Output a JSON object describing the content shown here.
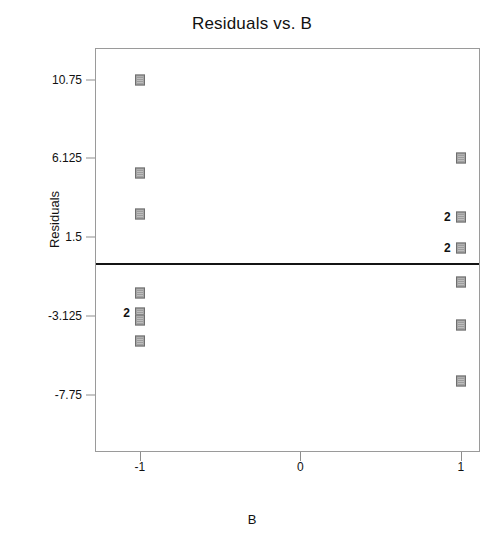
{
  "chart_data": {
    "type": "scatter",
    "title": "Residuals vs. B",
    "xlabel": "B",
    "ylabel": "Residuals",
    "grid": false,
    "legend": null,
    "xtick_labels": [
      "-1",
      "0",
      "1"
    ],
    "xtick_values": [
      -1,
      0,
      1
    ],
    "ytick_labels": [
      "10.75",
      "6.125",
      "1.5",
      "-3.125",
      "-7.75"
    ],
    "ytick_values": [
      10.75,
      6.125,
      1.5,
      -3.125,
      -7.75
    ],
    "xlim": [
      -1.28,
      1.12
    ],
    "ylim": [
      -11.1,
      12.6
    ],
    "reference_line": {
      "y": 0,
      "orientation": "horizontal",
      "color": "#141414"
    },
    "marker": {
      "shape": "square",
      "fill": "#a5a5a5",
      "edge": "#6e6e6e",
      "size": 10
    },
    "points": [
      {
        "x": -1,
        "y": 10.75,
        "count": 1,
        "count_label": ""
      },
      {
        "x": -1,
        "y": 5.25,
        "count": 1,
        "count_label": ""
      },
      {
        "x": -1,
        "y": 2.85,
        "count": 1,
        "count_label": ""
      },
      {
        "x": -1,
        "y": -1.8,
        "count": 1,
        "count_label": ""
      },
      {
        "x": -1,
        "y": -2.93,
        "count": 2,
        "count_label": "2"
      },
      {
        "x": -1,
        "y": -3.37,
        "count": 1,
        "count_label": ""
      },
      {
        "x": -1,
        "y": -4.59,
        "count": 1,
        "count_label": ""
      },
      {
        "x": 1,
        "y": 6.12,
        "count": 1,
        "count_label": ""
      },
      {
        "x": 1,
        "y": 2.71,
        "count": 2,
        "count_label": "2"
      },
      {
        "x": 1,
        "y": 0.85,
        "count": 2,
        "count_label": "2"
      },
      {
        "x": 1,
        "y": -1.12,
        "count": 1,
        "count_label": ""
      },
      {
        "x": 1,
        "y": -3.66,
        "count": 1,
        "count_label": ""
      },
      {
        "x": 1,
        "y": -6.93,
        "count": 1,
        "count_label": ""
      }
    ]
  },
  "axes": {
    "title": "Residuals vs. B",
    "y_axis_title": "Residuals",
    "x_axis_title": "B"
  }
}
